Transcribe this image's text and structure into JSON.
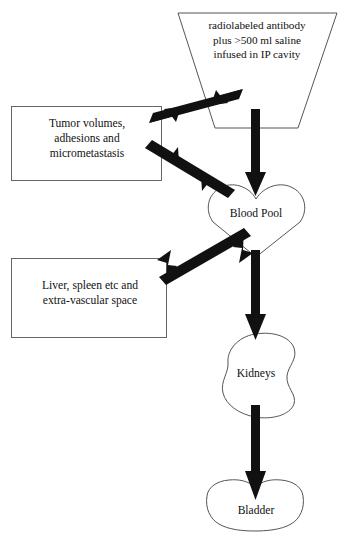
{
  "diagram": {
    "background_color": "#ffffff",
    "outline_color": "#4a4a4a",
    "arrow_color": "#111111",
    "text_color": "#111111",
    "nodes": [
      {
        "id": "infusion",
        "shape": "trapezoid",
        "label": "radiolabeled antibody\nplus >500 ml saline\ninfused in IP cavity"
      },
      {
        "id": "tumor",
        "shape": "rectangle",
        "label": "Tumor volumes,\nadhesions and\nmicrometastasis"
      },
      {
        "id": "liver",
        "shape": "rectangle",
        "label": "Liver, spleen etc and\nextra-vascular space"
      },
      {
        "id": "blood-pool",
        "shape": "heart",
        "label": "Blood Pool"
      },
      {
        "id": "kidneys",
        "shape": "bean",
        "label": "Kidneys"
      },
      {
        "id": "bladder",
        "shape": "bladder",
        "label": "Bladder"
      }
    ],
    "connectors": [
      {
        "id": "infusion-to-tumor",
        "from": "infusion",
        "to": "tumor",
        "style": "double-headed"
      },
      {
        "id": "infusion-to-blood-pool",
        "from": "infusion",
        "to": "blood-pool",
        "style": "single-headed"
      },
      {
        "id": "tumor-to-blood-pool",
        "from": "tumor",
        "to": "blood-pool",
        "style": "double-headed"
      },
      {
        "id": "blood-pool-to-liver",
        "from": "blood-pool",
        "to": "liver",
        "style": "double-headed"
      },
      {
        "id": "blood-pool-to-kidneys",
        "from": "blood-pool",
        "to": "kidneys",
        "style": "single-headed"
      },
      {
        "id": "kidneys-to-bladder",
        "from": "kidneys",
        "to": "bladder",
        "style": "single-headed"
      }
    ]
  }
}
